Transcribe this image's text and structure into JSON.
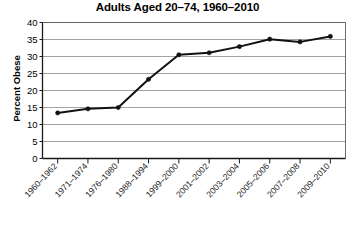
{
  "chart_data": {
    "type": "line",
    "title": "Adults Aged 20–74, 1960–2010",
    "xlabel": "",
    "ylabel": "Percent Obese",
    "categories": [
      "1960–1962",
      "1971–1974",
      "1976–1980",
      "1988–1994",
      "1999–2000",
      "2001–2002",
      "2003–2004",
      "2005–2006",
      "2007–2008",
      "2009–2010"
    ],
    "values": [
      13.4,
      14.6,
      15.0,
      23.3,
      30.5,
      31.1,
      32.9,
      35.1,
      34.3,
      35.9
    ],
    "ylim": [
      0,
      40
    ],
    "y_ticks": [
      0,
      5,
      10,
      15,
      20,
      25,
      30,
      35,
      40
    ],
    "grid": "horizontal",
    "legend": "none",
    "series_color": "#111111",
    "gridline_color": "#8c8c8c",
    "background_color": "#ffffff"
  }
}
